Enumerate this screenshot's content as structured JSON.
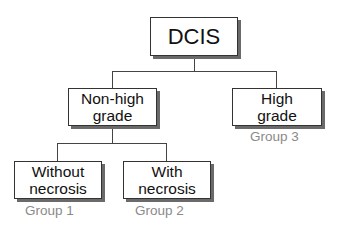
{
  "diagram": {
    "type": "tree",
    "root": {
      "label": "DCIS"
    },
    "level1": [
      {
        "label_line1": "Non-high",
        "label_line2": "grade"
      },
      {
        "label_line1": "High",
        "label_line2": "grade",
        "group": "Group 3"
      }
    ],
    "level2": [
      {
        "label_line1": "Without",
        "label_line2": "necrosis",
        "group": "Group 1"
      },
      {
        "label_line1": "With",
        "label_line2": "necrosis",
        "group": "Group 2"
      }
    ],
    "edges": [
      [
        "DCIS",
        "Non-high grade"
      ],
      [
        "DCIS",
        "High grade"
      ],
      [
        "Non-high grade",
        "Without necrosis"
      ],
      [
        "Non-high grade",
        "With necrosis"
      ]
    ]
  }
}
